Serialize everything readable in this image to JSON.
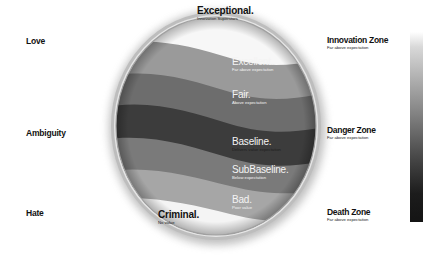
{
  "left_axis": {
    "labels": [
      {
        "id": "love",
        "text": "Love"
      },
      {
        "id": "ambiguity",
        "text": "Ambiguity"
      },
      {
        "id": "hate",
        "text": "Hate"
      }
    ]
  },
  "bands": [
    {
      "id": "exceptional",
      "title": "Exceptional.",
      "subtitle": "Innovation Superstars",
      "color": "#f7f7f7"
    },
    {
      "id": "excellent",
      "title": "Excellent.",
      "subtitle": "Far above expectation",
      "color": "#9a9a9a"
    },
    {
      "id": "fair",
      "title": "Fair.",
      "subtitle": "Above expectation",
      "color": "#6d6d6d"
    },
    {
      "id": "baseline",
      "title": "Baseline.",
      "subtitle": "Delivers value expectation",
      "color": "#3c3c3c"
    },
    {
      "id": "subbaseline",
      "title": "SubBaseline.",
      "subtitle": "Below expectation",
      "color": "#7a7a7a"
    },
    {
      "id": "bad",
      "title": "Bad.",
      "subtitle": "Poor value",
      "color": "#a6a6a6"
    },
    {
      "id": "criminal",
      "title": "Criminal.",
      "subtitle": "No value",
      "color": "#f4f4f4"
    }
  ],
  "zones": [
    {
      "id": "innovation",
      "title": "Innovation Zone",
      "subtitle": "Far above expectation"
    },
    {
      "id": "danger",
      "title": "Danger Zone",
      "subtitle": "Far above expectation"
    },
    {
      "id": "death",
      "title": "Death Zone",
      "subtitle": "Far above expectation"
    }
  ],
  "scale_bar": {
    "top_color": "#ffffff",
    "bottom_color": "#141414"
  }
}
